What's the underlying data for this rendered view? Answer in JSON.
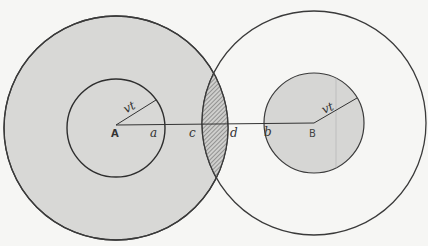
{
  "diagram": {
    "type": "two overlapping circle pairs with shaded intersection lens",
    "colors": {
      "shaded_fill": "#d6d6d4",
      "stroke": "#3a3a3a",
      "background": "#f6f6f4",
      "hatch": "#555555"
    },
    "circles": {
      "A_outer": {
        "cx": 116,
        "cy": 128,
        "r": 112,
        "filled": true
      },
      "A_inner": {
        "cx": 116,
        "cy": 128,
        "r": 49,
        "filled": true
      },
      "B_outer": {
        "cx": 314,
        "cy": 123,
        "r": 112,
        "filled": false
      },
      "B_inner": {
        "cx": 314,
        "cy": 123,
        "r": 50,
        "filled": true
      }
    },
    "labels": {
      "A": "A",
      "B": "B",
      "a": "a",
      "b": "b",
      "c": "c",
      "d": "d",
      "radius_A": "vt",
      "radius_B": "vt"
    }
  }
}
